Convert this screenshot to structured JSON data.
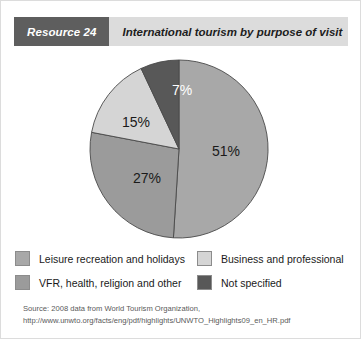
{
  "header": {
    "tag": "Resource 24",
    "title": "International tourism by purpose of visit"
  },
  "chart_data": {
    "type": "pie",
    "title": "International tourism by purpose of visit",
    "categories": [
      "Leisure recreation and holidays",
      "VFR, health, religion and other",
      "Business and professional",
      "Not specified"
    ],
    "values": [
      51,
      27,
      15,
      7
    ],
    "value_labels": [
      "51%",
      "27%",
      "15%",
      "7%"
    ],
    "unit": "percent",
    "colors": [
      "#a8a8a8",
      "#9b9b9b",
      "#d5d5d5",
      "#585858"
    ],
    "start_angle_deg": 0,
    "direction": "clockwise",
    "legend_position": "bottom",
    "grid": false
  },
  "legend": {
    "items": [
      {
        "label": "Leisure recreation and holidays",
        "color": "#a8a8a8"
      },
      {
        "label": "Business and professional",
        "color": "#d5d5d5"
      },
      {
        "label": "VFR, health, religion and other",
        "color": "#9b9b9b"
      },
      {
        "label": "Not specified",
        "color": "#585858"
      }
    ]
  },
  "source": {
    "line1": "Source: 2008 data from World Tourism Organization,",
    "line2": "http://www.unwto.org/facts/eng/pdf/highlights/UNWTO_Highlights09_en_HR.pdf"
  },
  "slice_labels": {
    "s0": "51%",
    "s1": "27%",
    "s2": "15%",
    "s3": "7%"
  }
}
